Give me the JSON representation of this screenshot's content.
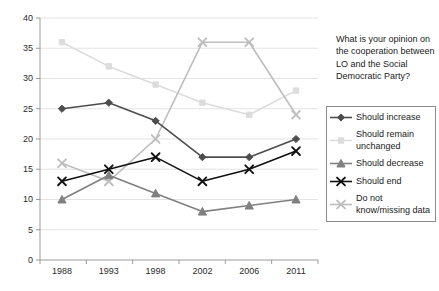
{
  "chart_data": {
    "type": "line",
    "title": "",
    "subtitle": "",
    "xlabel": "",
    "ylabel": "",
    "categories": [
      "1988",
      "1993",
      "1998",
      "2002",
      "2006",
      "2011"
    ],
    "x_tick_labels": [
      "1988",
      "1993",
      "1998",
      "2002",
      "2006",
      "2011"
    ],
    "y_tick_labels": [
      "0",
      "5",
      "10",
      "15",
      "20",
      "25",
      "30",
      "35",
      "40"
    ],
    "y_ticks": [
      0,
      5,
      10,
      15,
      20,
      25,
      30,
      35,
      40
    ],
    "ylim": [
      0,
      40
    ],
    "grid": "horizontal",
    "legend_position": "right",
    "series": [
      {
        "name": "Should increase",
        "values": [
          25,
          26,
          23,
          17,
          17,
          20
        ],
        "color": "#4d4d4d",
        "marker": "diamond"
      },
      {
        "name": "Should remain unchanged",
        "values": [
          36,
          32,
          29,
          26,
          24,
          28
        ],
        "color": "#dcdcdc",
        "marker": "square"
      },
      {
        "name": "Should decrease",
        "values": [
          10,
          14,
          11,
          8,
          9,
          10
        ],
        "color": "#808080",
        "marker": "triangle"
      },
      {
        "name": "Should end",
        "values": [
          13,
          15,
          17,
          13,
          15,
          18
        ],
        "color": "#111111",
        "marker": "cross"
      },
      {
        "name": "Do not know/missing data",
        "values": [
          16,
          13,
          20,
          36,
          36,
          24
        ],
        "color": "#bdbdbd",
        "marker": "cross"
      }
    ]
  },
  "side_panel": {
    "question": "What is your opinion on the cooperation between LO and the Social Democratic Party?",
    "legend_items": [
      {
        "label": "Should increase"
      },
      {
        "label": "Should remain unchanged"
      },
      {
        "label": "Should decrease"
      },
      {
        "label": "Should end"
      },
      {
        "label": "Do not know/missing data"
      }
    ]
  }
}
